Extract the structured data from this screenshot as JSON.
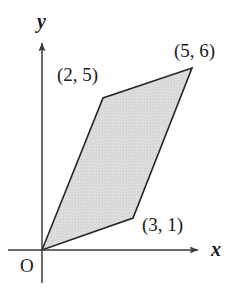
{
  "figure": {
    "background_color": "#ffffff",
    "axes": {
      "x_axis_label": "x",
      "y_axis_label": "y",
      "origin_label": "O",
      "axis_color": "#3d3d3d",
      "x_axis_pixel_y": 250,
      "y_axis_pixel_x": 42,
      "x_axis_start_px": 8,
      "x_axis_arrow_tip_px": 203,
      "y_axis_start_px": 283,
      "y_axis_arrow_tip_px": 37
    },
    "shape": {
      "name": "parallelogram",
      "fill_color": "#dcdcdc",
      "stroke_color": "#262626",
      "stroke_width": 1.6,
      "vertices": [
        {
          "label": "O",
          "x": 0,
          "y": 0,
          "px": 42,
          "py": 250
        },
        {
          "label": "(2, 5)",
          "x": 2,
          "y": 5,
          "px": 103,
          "py": 98
        },
        {
          "label": "(5, 6)",
          "x": 5,
          "y": 6,
          "px": 192,
          "py": 68
        },
        {
          "label": "(3, 1)",
          "x": 3,
          "y": 1,
          "px": 133,
          "py": 218
        }
      ]
    },
    "point_labels": {
      "upper_left": "(2, 5)",
      "upper_right": "(5, 6)",
      "lower_right": "(3, 1)"
    }
  },
  "chart_data": {
    "type": "scatter",
    "title": "",
    "xlabel": "x",
    "ylabel": "y",
    "grid": false,
    "legend": null,
    "xlim": [
      -1.1,
      5.3
    ],
    "ylim": [
      -1.1,
      7.0
    ],
    "annotations": [
      "O",
      "(2, 5)",
      "(5, 6)",
      "(3, 1)"
    ],
    "series": [
      {
        "name": "parallelogram",
        "kind": "polygon",
        "closed": true,
        "fill": "#dcdcdc",
        "x": [
          0,
          2,
          5,
          3
        ],
        "y": [
          0,
          5,
          6,
          1
        ]
      }
    ],
    "points": [
      {
        "label": "O",
        "x": 0,
        "y": 0
      },
      {
        "label": "(2, 5)",
        "x": 2,
        "y": 5
      },
      {
        "label": "(5, 6)",
        "x": 5,
        "y": 6
      },
      {
        "label": "(3, 1)",
        "x": 3,
        "y": 1
      }
    ]
  }
}
